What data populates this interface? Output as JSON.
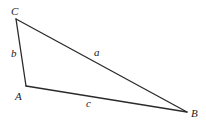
{
  "diagram": {
    "type": "triangle",
    "vertices": {
      "A": {
        "label": "A"
      },
      "B": {
        "label": "B"
      },
      "C": {
        "label": "C"
      }
    },
    "sides": {
      "a": {
        "label": "a",
        "from": "B",
        "to": "C"
      },
      "b": {
        "label": "b",
        "from": "A",
        "to": "C"
      },
      "c": {
        "label": "c",
        "from": "A",
        "to": "B"
      }
    }
  }
}
